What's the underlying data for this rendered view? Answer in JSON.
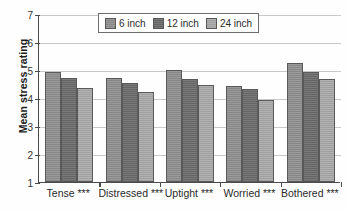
{
  "chart_data": {
    "type": "bar",
    "title": "",
    "xlabel": "",
    "ylabel": "Mean stress rating",
    "ylim": [
      1,
      7
    ],
    "yticks": [
      1,
      2,
      3,
      4,
      5,
      6,
      7
    ],
    "ytick_labels": [
      "1",
      "2",
      "3",
      "4",
      "5",
      "6",
      "7"
    ],
    "grid": true,
    "legend_position": "top-center",
    "categories": [
      "Tense ***",
      "Distressed ***",
      "Uptight ***",
      "Worried ***",
      "Bothered ***"
    ],
    "series": [
      {
        "name": "6 inch",
        "color": "#8e8e8e",
        "values": [
          4.92,
          4.72,
          5.01,
          4.44,
          5.26
        ]
      },
      {
        "name": "12 inch",
        "color": "#6a6a6a",
        "values": [
          4.72,
          4.55,
          4.69,
          4.33,
          4.92
        ]
      },
      {
        "name": "24 inch",
        "color": "#a8a8a8",
        "values": [
          4.36,
          4.21,
          4.45,
          3.93,
          4.68
        ]
      }
    ]
  }
}
